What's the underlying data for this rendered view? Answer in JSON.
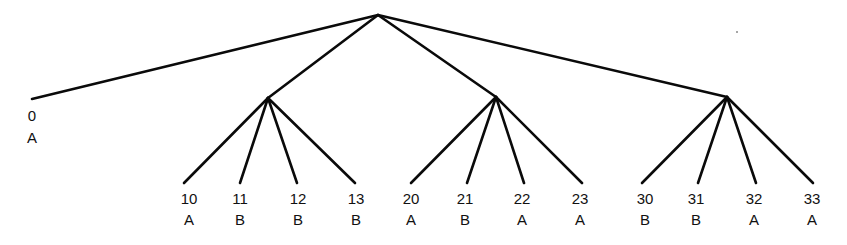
{
  "diagram": {
    "type": "tree",
    "root": {
      "x": 378,
      "y": 15
    },
    "internal_nodes": [
      {
        "id": "n1",
        "x": 268,
        "y": 98
      },
      {
        "id": "n2",
        "x": 496,
        "y": 97
      },
      {
        "id": "n3",
        "x": 727,
        "y": 97
      }
    ],
    "leaves": [
      {
        "id": "0",
        "label": "0",
        "class": "A",
        "parent": "root",
        "x": 32,
        "y": 99,
        "lx": 32,
        "ly1": 107,
        "ly2": 129
      },
      {
        "id": "10",
        "label": "10",
        "class": "A",
        "parent": "n1",
        "x": 184,
        "y": 183,
        "lx": 189,
        "ly1": 190,
        "ly2": 211
      },
      {
        "id": "11",
        "label": "11",
        "class": "B",
        "parent": "n1",
        "x": 240,
        "y": 183,
        "lx": 240,
        "ly1": 190,
        "ly2": 211
      },
      {
        "id": "12",
        "label": "12",
        "class": "B",
        "parent": "n1",
        "x": 297,
        "y": 183,
        "lx": 298,
        "ly1": 190,
        "ly2": 211
      },
      {
        "id": "13",
        "label": "13",
        "class": "B",
        "parent": "n1",
        "x": 355,
        "y": 183,
        "lx": 356,
        "ly1": 190,
        "ly2": 211
      },
      {
        "id": "20",
        "label": "20",
        "class": "A",
        "parent": "n2",
        "x": 411,
        "y": 183,
        "lx": 411,
        "ly1": 190,
        "ly2": 211
      },
      {
        "id": "21",
        "label": "21",
        "class": "B",
        "parent": "n2",
        "x": 467,
        "y": 183,
        "lx": 465,
        "ly1": 190,
        "ly2": 211
      },
      {
        "id": "22",
        "label": "22",
        "class": "A",
        "parent": "n2",
        "x": 524,
        "y": 183,
        "lx": 522,
        "ly1": 190,
        "ly2": 211
      },
      {
        "id": "23",
        "label": "23",
        "class": "A",
        "parent": "n2",
        "x": 582,
        "y": 183,
        "lx": 580,
        "ly1": 190,
        "ly2": 211
      },
      {
        "id": "30",
        "label": "30",
        "class": "B",
        "parent": "n3",
        "x": 642,
        "y": 183,
        "lx": 645,
        "ly1": 190,
        "ly2": 211
      },
      {
        "id": "31",
        "label": "31",
        "class": "B",
        "parent": "n3",
        "x": 698,
        "y": 183,
        "lx": 696,
        "ly1": 190,
        "ly2": 211
      },
      {
        "id": "32",
        "label": "32",
        "class": "A",
        "parent": "n3",
        "x": 756,
        "y": 183,
        "lx": 754,
        "ly1": 190,
        "ly2": 211
      },
      {
        "id": "33",
        "label": "33",
        "class": "A",
        "parent": "n3",
        "x": 813,
        "y": 183,
        "lx": 812,
        "ly1": 190,
        "ly2": 211
      }
    ],
    "stray_dot": {
      "x": 736,
      "y": 31
    }
  }
}
